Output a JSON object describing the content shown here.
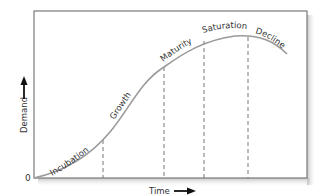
{
  "diagram": {
    "type": "product-life-cycle",
    "x_axis_label": "Time",
    "y_axis_label": "Demand",
    "origin_label": "0",
    "stages": [
      {
        "label": "Incubation"
      },
      {
        "label": "Growth"
      },
      {
        "label": "Maturity"
      },
      {
        "label": "Saturation"
      },
      {
        "label": "Decline"
      }
    ],
    "colors": {
      "frame": "#7a7a7a",
      "curve": "#9a9a9a",
      "dashed": "#666666",
      "text": "#333333",
      "shadow": "#cfcfcf"
    }
  }
}
